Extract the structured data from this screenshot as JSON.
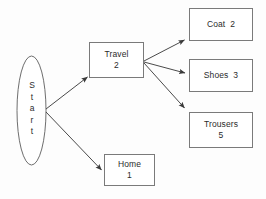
{
  "diagram": {
    "background_color": "#fdfdfd",
    "stroke_color": "#6e6e6e",
    "text_color": "#2b2b2b",
    "start": {
      "label": "Start",
      "letters": [
        "S",
        "t",
        "a",
        "r",
        "t"
      ],
      "shape": "ellipse"
    },
    "nodes": [
      {
        "id": "travel",
        "name": "Travel",
        "count": "2",
        "lines": [
          "Travel",
          "2"
        ]
      },
      {
        "id": "home",
        "name": "Home",
        "count": "1",
        "lines": [
          "Home",
          "1"
        ]
      },
      {
        "id": "coat",
        "name": "Coat",
        "count": "2",
        "lines": [
          "Coat  2"
        ]
      },
      {
        "id": "shoes",
        "name": "Shoes",
        "count": "3",
        "lines": [
          "Shoes  3"
        ]
      },
      {
        "id": "trousers",
        "name": "Trousers",
        "count": "5",
        "lines": [
          "Trousers",
          "5"
        ]
      }
    ],
    "edges": [
      {
        "from": "start",
        "to": "travel"
      },
      {
        "from": "start",
        "to": "home"
      },
      {
        "from": "travel",
        "to": "coat"
      },
      {
        "from": "travel",
        "to": "shoes"
      },
      {
        "from": "travel",
        "to": "trousers"
      }
    ]
  }
}
